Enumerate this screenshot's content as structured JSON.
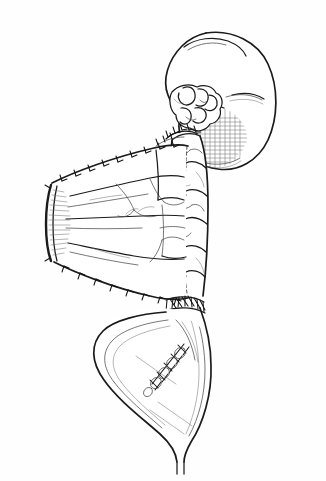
{
  "figure": {
    "caption": "",
    "orientation": "portrait",
    "style": "line-art",
    "background_color": "#ffffff",
    "ink_color": "#1a1a1a",
    "shade_color": "#555555",
    "frame_color": "#8a8a8a"
  },
  "frame": {
    "x": 8,
    "y": 13,
    "width": 298,
    "height": 453,
    "stroke_width": 1
  },
  "structures": [
    {
      "id": "kidney",
      "label": "Kidney",
      "position": "upper-right",
      "notes": "Reniform organ with hilar vessels; shaded inferior pole"
    },
    {
      "id": "hilar-vessels",
      "label": "Hilar vessels / lobulated tissue",
      "position": "kidney-hilum",
      "notes": "Cluster of rounded lobules at the renal hilum"
    },
    {
      "id": "upper-anastomosis",
      "label": "Upper suture line",
      "position": "below-hilum",
      "notes": "Interrupted suture row joining conduit to renal pelvis"
    },
    {
      "id": "bowel-patch",
      "label": "Detubularized bowel patch",
      "position": "middle-left",
      "notes": "Opened bowel segment, wedge shaped, with mucosal folds and mesenteric vessels; free cut edge at the left"
    },
    {
      "id": "cut-edge",
      "label": "Open cut bowel edge",
      "position": "far-left",
      "notes": "Dark thickened rim with radiating mucosal striations"
    },
    {
      "id": "bowel-conduit",
      "label": "Tubular bowel conduit",
      "position": "center-vertical",
      "notes": "Vertical tube with dashed midline closure and segmental haustral markings"
    },
    {
      "id": "lower-anastomosis",
      "label": "Lower suture line",
      "position": "conduit-to-bladder",
      "notes": "Circumferential interrupted suture row at the bladder junction"
    },
    {
      "id": "bladder",
      "label": "Bladder",
      "position": "lower-center",
      "notes": "Pear-shaped viscus tapering to the urethra, with an oblique closure suture line on its anterior wall"
    },
    {
      "id": "bladder-suture-line",
      "label": "Bladder closure suture line",
      "position": "bladder-anterior-wall",
      "notes": "Oblique row of interrupted stitches"
    },
    {
      "id": "urethra",
      "label": "Urethra",
      "position": "bottom",
      "notes": "Narrow tubular outlet at the bladder neck"
    }
  ]
}
